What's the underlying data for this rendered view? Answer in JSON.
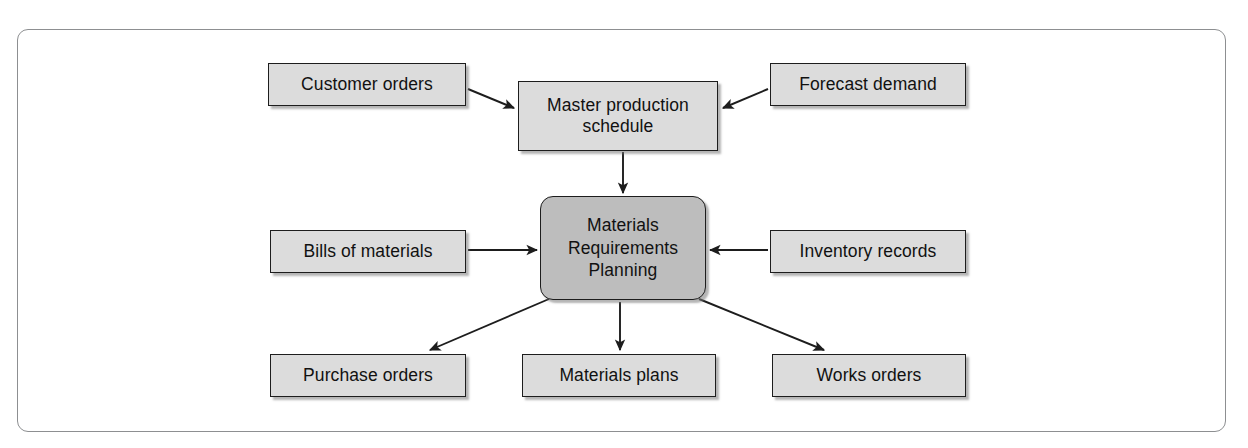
{
  "diagram": {
    "frame": {
      "stroke": "#8d8f91"
    },
    "palette": {
      "box_fill": "#dcdcdc",
      "center_fill": "#bdbdbd",
      "box_stroke": "#1d1d1d",
      "arrow_stroke": "#1d1d1d",
      "background": "#ffffff"
    },
    "nodes": [
      {
        "id": "customer-orders",
        "label": "Customer orders",
        "x": 268,
        "y": 63,
        "w": 198,
        "h": 43,
        "kind": "input"
      },
      {
        "id": "master-production-schedule",
        "label": "Master production\nschedule",
        "x": 518,
        "y": 81,
        "w": 200,
        "h": 70,
        "kind": "process"
      },
      {
        "id": "forecast-demand",
        "label": "Forecast demand",
        "x": 770,
        "y": 63,
        "w": 196,
        "h": 43,
        "kind": "input"
      },
      {
        "id": "bills-of-materials",
        "label": "Bills of materials",
        "x": 270,
        "y": 230,
        "w": 196,
        "h": 43,
        "kind": "input"
      },
      {
        "id": "mrp",
        "label": "Materials\nRequirements\nPlanning",
        "x": 540,
        "y": 196,
        "w": 166,
        "h": 104,
        "kind": "center"
      },
      {
        "id": "inventory-records",
        "label": "Inventory records",
        "x": 770,
        "y": 230,
        "w": 196,
        "h": 43,
        "kind": "input"
      },
      {
        "id": "purchase-orders",
        "label": "Purchase orders",
        "x": 270,
        "y": 354,
        "w": 196,
        "h": 43,
        "kind": "output"
      },
      {
        "id": "materials-plans",
        "label": "Materials plans",
        "x": 522,
        "y": 354,
        "w": 194,
        "h": 43,
        "kind": "output"
      },
      {
        "id": "works-orders",
        "label": "Works orders",
        "x": 772,
        "y": 354,
        "w": 194,
        "h": 43,
        "kind": "output"
      }
    ],
    "edges": [
      {
        "id": "customer-orders-to-mps",
        "from": "customer-orders",
        "to": "master-production-schedule"
      },
      {
        "id": "forecast-demand-to-mps",
        "from": "forecast-demand",
        "to": "master-production-schedule"
      },
      {
        "id": "mps-to-mrp",
        "from": "master-production-schedule",
        "to": "mrp"
      },
      {
        "id": "bom-to-mrp",
        "from": "bills-of-materials",
        "to": "mrp"
      },
      {
        "id": "inventory-to-mrp",
        "from": "inventory-records",
        "to": "mrp"
      },
      {
        "id": "mrp-to-purchase-orders",
        "from": "mrp",
        "to": "purchase-orders"
      },
      {
        "id": "mrp-to-materials-plans",
        "from": "mrp",
        "to": "materials-plans"
      },
      {
        "id": "mrp-to-works-orders",
        "from": "mrp",
        "to": "works-orders"
      }
    ]
  }
}
